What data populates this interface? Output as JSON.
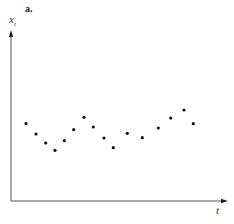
{
  "chart_data": {
    "type": "scatter",
    "panel_label": "a.",
    "title": "",
    "xlabel": "t",
    "ylabel": "x",
    "ylabel_subscript": "t",
    "grid": false,
    "legend": null,
    "ticks": false,
    "axes": {
      "origin_px": [
        11,
        201
      ],
      "x_end_px": 228,
      "y_end_px": 30,
      "color": "#555555"
    },
    "point_color": "#111111",
    "point_radius": 1.6,
    "points_px": [
      [
        26,
        123.7
      ],
      [
        36,
        134
      ],
      [
        45.7,
        143
      ],
      [
        55,
        150.3
      ],
      [
        64.3,
        140.7
      ],
      [
        73.7,
        129.7
      ],
      [
        84,
        117.3
      ],
      [
        93.3,
        127
      ],
      [
        104,
        138
      ],
      [
        113.3,
        147.7
      ],
      [
        127.3,
        133.3
      ],
      [
        142.3,
        137.7
      ],
      [
        158.3,
        128
      ],
      [
        170.7,
        118
      ],
      [
        184,
        110
      ],
      [
        193.3,
        123.7
      ]
    ],
    "x": [
      1,
      2,
      3,
      4,
      5,
      6,
      7,
      8,
      9,
      10,
      11,
      12,
      13,
      14,
      15,
      16
    ],
    "values_relative_height": [
      0.45,
      0.39,
      0.34,
      0.3,
      0.35,
      0.42,
      0.49,
      0.43,
      0.37,
      0.31,
      0.4,
      0.37,
      0.43,
      0.49,
      0.53,
      0.45
    ]
  }
}
